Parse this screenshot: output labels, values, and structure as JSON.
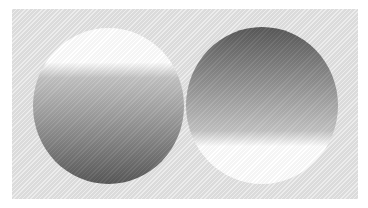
{
  "figure": {
    "background_color": "#e2e2e2",
    "circles": [
      {
        "id": "left",
        "description": "Circle lit from above: white at top fading to dark gray at bottom",
        "gradient": [
          {
            "stop": "0%",
            "color": "#ffffff"
          },
          {
            "stop": "22%",
            "color": "#ffffff"
          },
          {
            "stop": "32%",
            "color": "#c4c4c4"
          },
          {
            "stop": "60%",
            "color": "#9a9a9a"
          },
          {
            "stop": "100%",
            "color": "#5a5a5a"
          }
        ]
      },
      {
        "id": "right",
        "description": "Circle lit from below: dark gray at top fading to white at bottom",
        "gradient": [
          {
            "stop": "0%",
            "color": "#5a5a5a"
          },
          {
            "stop": "40%",
            "color": "#9a9a9a"
          },
          {
            "stop": "66%",
            "color": "#c4c4c4"
          },
          {
            "stop": "76%",
            "color": "#ffffff"
          },
          {
            "stop": "100%",
            "color": "#ffffff"
          }
        ]
      }
    ]
  }
}
